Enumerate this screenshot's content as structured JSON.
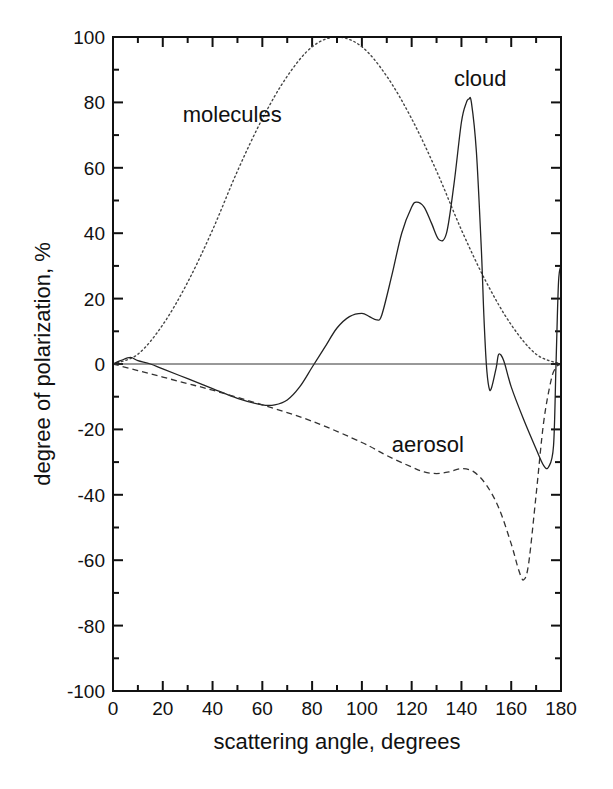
{
  "chart_data": {
    "type": "line",
    "title": "",
    "xlabel": "scattering angle, degrees",
    "ylabel": "degree of polarization, %",
    "xlim": [
      0,
      180
    ],
    "ylim": [
      -100,
      100
    ],
    "xticks": [
      0,
      20,
      40,
      60,
      80,
      100,
      120,
      140,
      160,
      180
    ],
    "yticks": [
      -100,
      -80,
      -60,
      -40,
      -20,
      0,
      20,
      40,
      60,
      80,
      100
    ],
    "grid": false,
    "legend": "none (inline annotations)",
    "annotations": [
      {
        "text": "molecules",
        "x": 28,
        "y": 74
      },
      {
        "text": "cloud",
        "x": 137,
        "y": 85
      },
      {
        "text": "aerosol",
        "x": 112,
        "y": -27
      }
    ],
    "series": [
      {
        "name": "molecules",
        "style": "dotted",
        "x": [
          0,
          10,
          20,
          30,
          40,
          50,
          60,
          70,
          80,
          90,
          100,
          110,
          120,
          130,
          140,
          150,
          160,
          170,
          180
        ],
        "y": [
          0,
          3,
          12,
          25,
          41,
          59,
          75,
          88,
          97,
          100,
          97,
          88,
          75,
          59,
          41,
          25,
          12,
          3,
          0
        ]
      },
      {
        "name": "cloud",
        "style": "solid",
        "x": [
          0,
          3,
          7,
          10,
          15,
          20,
          30,
          40,
          50,
          60,
          65,
          70,
          75,
          80,
          85,
          90,
          95,
          100,
          103,
          106,
          108,
          112,
          116,
          120,
          122,
          125,
          128,
          131,
          134,
          137,
          140,
          142,
          143,
          144,
          146,
          148,
          149,
          150,
          151,
          152,
          154,
          155,
          157,
          160,
          165,
          170,
          173,
          175,
          177,
          178,
          179,
          180
        ],
        "y": [
          0,
          1,
          2,
          1,
          0,
          -1.5,
          -4.5,
          -7.5,
          -10.5,
          -12.5,
          -12.5,
          -11,
          -7,
          -1,
          5,
          11,
          14.5,
          15.5,
          14.5,
          13.5,
          15,
          27,
          40,
          48,
          49.5,
          48,
          43,
          38,
          40,
          55,
          74,
          80,
          81,
          80,
          65,
          35,
          15,
          0,
          -7,
          -7.5,
          -1,
          3,
          1,
          -7,
          -17,
          -26,
          -31,
          -31.5,
          -25,
          0,
          25,
          30
        ]
      },
      {
        "name": "aerosol",
        "style": "dashed",
        "x": [
          0,
          10,
          20,
          30,
          40,
          60,
          80,
          100,
          110,
          120,
          125,
          130,
          135,
          140,
          145,
          150,
          155,
          160,
          163,
          165,
          167,
          170,
          173,
          176,
          178,
          180
        ],
        "y": [
          0,
          -2,
          -4,
          -6,
          -8,
          -12.5,
          -17.5,
          -24,
          -28,
          -31.5,
          -33,
          -33.5,
          -33,
          -32,
          -33,
          -37,
          -44,
          -55,
          -63,
          -66,
          -61,
          -40,
          -18,
          -5,
          -1,
          0
        ]
      },
      {
        "name": "zero line",
        "style": "solid-thin",
        "x": [
          0,
          180
        ],
        "y": [
          0,
          0
        ]
      }
    ]
  }
}
